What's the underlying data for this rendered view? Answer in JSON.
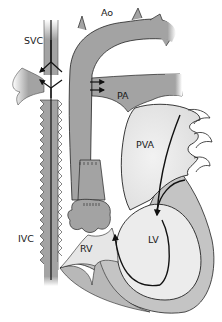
{
  "diagram": {
    "type": "anatomical-heart-schematic",
    "labels": {
      "svc": "SVC",
      "ao": "Ao",
      "pa": "PA",
      "pva": "PVA",
      "ivc": "IVC",
      "rv": "RV",
      "lv": "LV"
    },
    "colors": {
      "vessel_fill": "#a3a3a3",
      "chamber_light": "#e6e6e6",
      "myocardium": "#c4c4c4",
      "outline": "#222222",
      "arrow": "#111111",
      "background": "#ffffff"
    },
    "flow_arrows": [
      {
        "from": "SVC",
        "direction": "down",
        "note": "arrow into junction"
      },
      {
        "from": "IVC",
        "direction": "up",
        "note": "arrow into junction"
      },
      {
        "from": "Ao-junction",
        "to": "PA",
        "count": 2,
        "direction": "right"
      },
      {
        "from": "PVA",
        "to": "LV",
        "direction": "down"
      },
      {
        "from": "LV",
        "to": "RV",
        "direction": "up",
        "note": "loop arrow"
      }
    ]
  }
}
